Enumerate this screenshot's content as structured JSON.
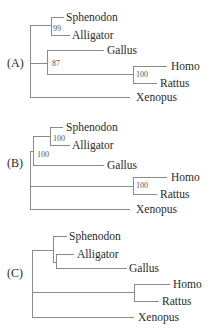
{
  "figure": {
    "panels": [
      {
        "label": "(A)",
        "taxa": [
          "Sphenodon",
          "Alligator",
          "Gallus",
          "Homo",
          "Rattus",
          "Xenopus"
        ],
        "support_values": {
          "sphenodon_alligator": "99",
          "gallus_mammals": "87",
          "homo_rattus": "100"
        }
      },
      {
        "label": "(B)",
        "taxa": [
          "Sphenodon",
          "Alligator",
          "Gallus",
          "Homo",
          "Rattus",
          "Xenopus"
        ],
        "support_values": {
          "sphenodon_alligator": "100",
          "reptiles_birds": "100",
          "homo_rattus": "100"
        }
      },
      {
        "label": "(C)",
        "taxa": [
          "Sphenodon",
          "Alligator",
          "Gallus",
          "Homo",
          "Rattus",
          "Xenopus"
        ],
        "support_values": {}
      }
    ]
  }
}
